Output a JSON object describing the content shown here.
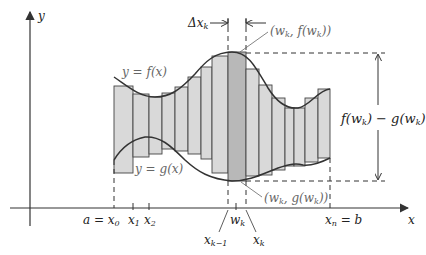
{
  "figure": {
    "colors": {
      "strip_fill": "#d9d9d9",
      "highlight_fill": "#b5b5b5",
      "curve": "#333333",
      "axis": "#333333",
      "label_gray": "#666666"
    },
    "axes": {
      "x_label": "x",
      "y_label": "y"
    },
    "curves": {
      "upper_label": "y = f(x)",
      "lower_label": "y = g(x)"
    },
    "ticks": {
      "a_eq": "a = x",
      "x0_sub": "0",
      "x1": "x",
      "x1_sub": "1",
      "x2": "x",
      "x2_sub": "2",
      "xk_minus_1": "x",
      "xk_minus_1_sub": "k−1",
      "wk": "w",
      "wk_sub": "k",
      "xk": "x",
      "xk_sub": "k",
      "xn": "x",
      "xn_sub": "n",
      "xn_eq_b": " = b"
    },
    "annotations": {
      "delta_x": "Δx",
      "delta_x_sub": "k",
      "top_point_pre": "(w",
      "top_point_sub": "k",
      "top_point_post": ", f(w",
      "top_point_sub2": "k",
      "top_point_end": "))",
      "bottom_point_pre": "(w",
      "bottom_point_sub": "k",
      "bottom_point_post": ", g(w",
      "bottom_point_sub2": "k",
      "bottom_point_end": "))",
      "height_f": "f(w",
      "height_f_sub": "k",
      "height_mid": ") − g(w",
      "height_g_sub": "k",
      "height_end": ")"
    }
  }
}
